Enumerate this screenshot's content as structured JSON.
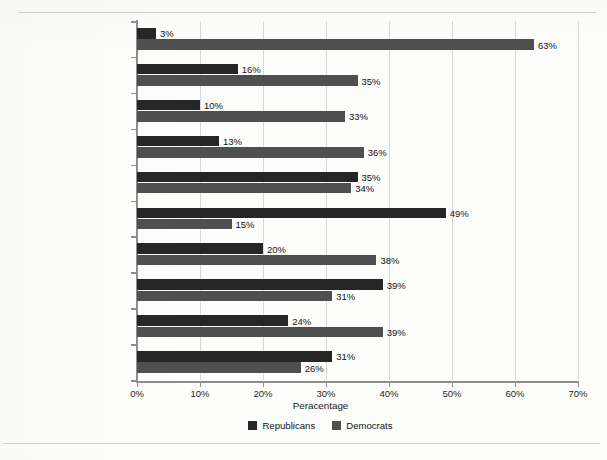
{
  "chart_data": {
    "type": "bar",
    "orientation": "horizontal",
    "title": "",
    "xlabel": "Peracentage",
    "ylabel": "",
    "xlim": [
      0,
      70
    ],
    "xticks": [
      "0%",
      "10%",
      "20%",
      "30%",
      "40%",
      "50%",
      "60%",
      "70%"
    ],
    "xtick_values": [
      0,
      10,
      20,
      30,
      40,
      50,
      60,
      70
    ],
    "grid": "light vertical gridlines",
    "legend_position": "bottom-center",
    "categories": [
      "African American",
      "Hispanic",
      "Asian American",
      "Jewish",
      "White Catholic",
      "White Evangelical",
      "Income below $30,000",
      "Income above $150,000",
      "Female",
      "Male"
    ],
    "series": [
      {
        "name": "Republicans",
        "color": "#262626",
        "values": [
          3,
          16,
          10,
          13,
          35,
          49,
          20,
          39,
          24,
          31
        ],
        "labels": [
          "3%",
          "16%",
          "10%",
          "13%",
          "35%",
          "49%",
          "20%",
          "39%",
          "24%",
          "31%"
        ]
      },
      {
        "name": "Democrats",
        "color": "#4f4f4f",
        "values": [
          63,
          35,
          33,
          36,
          34,
          15,
          38,
          31,
          39,
          26
        ],
        "labels": [
          "63%",
          "35%",
          "33%",
          "36%",
          "34%",
          "15%",
          "38%",
          "31%",
          "39%",
          "26%"
        ]
      }
    ]
  },
  "legend": {
    "items": [
      {
        "label": "Republicans",
        "color": "#262626"
      },
      {
        "label": "Democrats",
        "color": "#4f4f4f"
      }
    ]
  },
  "footer": {
    "text": ""
  }
}
